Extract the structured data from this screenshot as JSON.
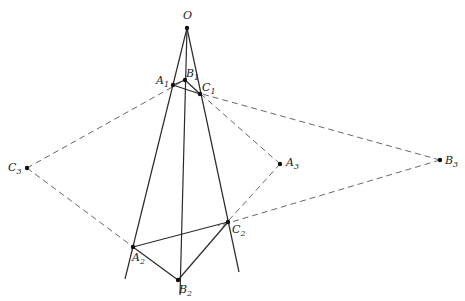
{
  "diagram": {
    "title": "",
    "colors": {
      "line": "#2a2a2a",
      "dashed": "#555555",
      "point": "#111111"
    },
    "points": {
      "O": {
        "label": "O",
        "sub": "",
        "x": 187,
        "y": 28
      },
      "A1": {
        "label": "A",
        "sub": "1",
        "x": 173,
        "y": 85
      },
      "B1": {
        "label": "B",
        "sub": "1",
        "x": 185,
        "y": 80
      },
      "C1": {
        "label": "C",
        "sub": "1",
        "x": 200,
        "y": 94
      },
      "A2": {
        "label": "A",
        "sub": "2",
        "x": 133,
        "y": 247
      },
      "B2": {
        "label": "B",
        "sub": "2",
        "x": 178,
        "y": 280
      },
      "C2": {
        "label": "C",
        "sub": "2",
        "x": 228,
        "y": 222
      },
      "A3": {
        "label": "A",
        "sub": "3",
        "x": 280,
        "y": 164
      },
      "B3": {
        "label": "B",
        "sub": "3",
        "x": 440,
        "y": 160
      },
      "C3": {
        "label": "C",
        "sub": "3",
        "x": 27,
        "y": 168
      }
    },
    "solid_lines": [
      [
        "O",
        "A2-ext"
      ],
      [
        "O",
        "B2-ext"
      ],
      [
        "O",
        "C2-ext"
      ],
      [
        "A1",
        "B1"
      ],
      [
        "B1",
        "C1"
      ],
      [
        "A1",
        "C1"
      ],
      [
        "A2",
        "B2"
      ],
      [
        "B2",
        "C2"
      ],
      [
        "A2",
        "C2"
      ]
    ],
    "dashed_lines": [
      [
        "C3",
        "A1"
      ],
      [
        "C3",
        "A2"
      ],
      [
        "A3",
        "C1"
      ],
      [
        "A3",
        "C2"
      ],
      [
        "B3",
        "C1"
      ],
      [
        "B3",
        "C2"
      ]
    ],
    "labels": {
      "O": "O",
      "A1": "A",
      "A1_sub": "1",
      "B1": "B",
      "B1_sub": "1",
      "C1": "C",
      "C1_sub": "1",
      "A2": "A",
      "A2_sub": "2",
      "B2": "B",
      "B2_sub": "2",
      "C2": "C",
      "C2_sub": "2",
      "A3": "A",
      "A3_sub": "3",
      "B3": "B",
      "B3_sub": "3",
      "C3": "C",
      "C3_sub": "3"
    }
  }
}
